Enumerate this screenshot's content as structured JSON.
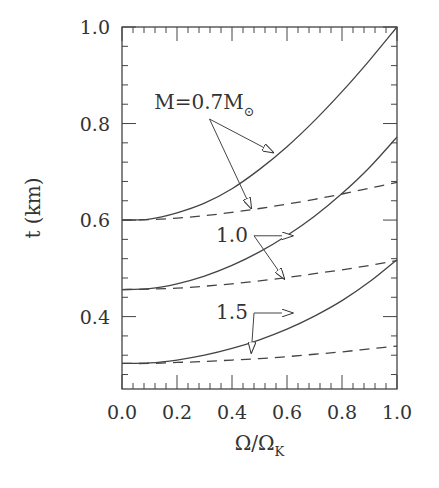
{
  "chart_data": {
    "type": "line",
    "title": "",
    "xlabel": "Ω/Ω",
    "xlabel_subscript": "K",
    "ylabel": "t  (km)",
    "xlim": [
      0.0,
      1.0
    ],
    "ylim": [
      0.25,
      1.0
    ],
    "grid": false,
    "legend": "none",
    "x_ticks": [
      "0.0",
      "0.2",
      "0.4",
      "0.6",
      "0.8",
      "1.0"
    ],
    "x_tick_values": [
      0.0,
      0.2,
      0.4,
      0.6,
      0.8,
      1.0
    ],
    "y_ticks": [
      "0.4",
      "0.6",
      "0.8",
      "1.0"
    ],
    "y_tick_values": [
      0.4,
      0.6,
      0.8,
      1.0
    ],
    "x": [
      0.0,
      0.1,
      0.2,
      0.3,
      0.4,
      0.5,
      0.6,
      0.7,
      0.8,
      0.9,
      1.0
    ],
    "series": [
      {
        "name": "M=0.7 solid",
        "mass": "0.7",
        "style": "solid",
        "values": [
          0.6,
          0.602,
          0.615,
          0.635,
          0.665,
          0.705,
          0.752,
          0.806,
          0.866,
          0.931,
          1.0
        ]
      },
      {
        "name": "M=0.7 dashed",
        "mass": "0.7",
        "style": "dashed",
        "values": [
          0.6,
          0.601,
          0.604,
          0.609,
          0.616,
          0.624,
          0.633,
          0.643,
          0.654,
          0.666,
          0.678
        ]
      },
      {
        "name": "M=1.0 solid",
        "mass": "1.0",
        "style": "solid",
        "values": [
          0.456,
          0.458,
          0.468,
          0.484,
          0.506,
          0.534,
          0.568,
          0.608,
          0.655,
          0.709,
          0.772
        ]
      },
      {
        "name": "M=1.0 dashed",
        "mass": "1.0",
        "style": "dashed",
        "values": [
          0.456,
          0.457,
          0.459,
          0.463,
          0.468,
          0.474,
          0.481,
          0.489,
          0.497,
          0.506,
          0.516
        ]
      },
      {
        "name": "M=1.5 solid",
        "mass": "1.5",
        "style": "solid",
        "values": [
          0.303,
          0.304,
          0.31,
          0.32,
          0.334,
          0.352,
          0.374,
          0.401,
          0.433,
          0.472,
          0.518
        ]
      },
      {
        "name": "M=1.5 dashed",
        "mass": "1.5",
        "style": "dashed",
        "values": [
          0.303,
          0.303,
          0.305,
          0.307,
          0.31,
          0.313,
          0.317,
          0.322,
          0.327,
          0.333,
          0.339
        ]
      }
    ],
    "annotations": [
      {
        "text": "M=0.7M",
        "subscript": "⊙",
        "x": 0.3,
        "y": 0.83,
        "arrows_to": [
          {
            "x": 0.55,
            "y": 0.74
          },
          {
            "x": 0.47,
            "y": 0.624
          }
        ]
      },
      {
        "text": "1.0",
        "x": 0.4,
        "y": 0.555,
        "arrows_to": [
          {
            "x": 0.62,
            "y": 0.565
          },
          {
            "x": 0.59,
            "y": 0.478
          }
        ]
      },
      {
        "text": "1.5",
        "x": 0.4,
        "y": 0.395,
        "arrows_to": [
          {
            "x": 0.62,
            "y": 0.396
          },
          {
            "x": 0.47,
            "y": 0.325
          }
        ]
      }
    ]
  }
}
